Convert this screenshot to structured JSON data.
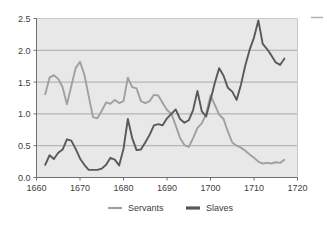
{
  "chart_data": {
    "type": "line",
    "title": "",
    "subtitle": "",
    "xlabel": "",
    "ylabel": "",
    "xlim": [
      1660,
      1720
    ],
    "ylim": [
      0.0,
      2.5
    ],
    "grid": true,
    "legend_position": "bottom",
    "plot_background": "#e8e8e8",
    "x_ticks": [
      "1660",
      "1670",
      "1680",
      "1690",
      "1700",
      "1710",
      "1720"
    ],
    "x_tick_values": [
      1660,
      1670,
      1680,
      1690,
      1700,
      1710,
      1720
    ],
    "y_ticks": [
      "0.0",
      "0.5",
      "1.0",
      "1.5",
      "2.0",
      "2.5"
    ],
    "y_tick_values": [
      0.0,
      0.5,
      1.0,
      1.5,
      2.0,
      2.5
    ],
    "series": [
      {
        "name": "Servants",
        "color": "#a0a0a0",
        "x": [
          1662,
          1663,
          1664,
          1665,
          1666,
          1667,
          1668,
          1669,
          1670,
          1671,
          1672,
          1673,
          1674,
          1675,
          1676,
          1677,
          1678,
          1679,
          1680,
          1681,
          1682,
          1683,
          1684,
          1685,
          1686,
          1687,
          1688,
          1689,
          1690,
          1691,
          1692,
          1693,
          1694,
          1695,
          1696,
          1697,
          1698,
          1699,
          1700,
          1701,
          1702,
          1703,
          1704,
          1705,
          1706,
          1707,
          1708,
          1709,
          1710,
          1711,
          1712,
          1713,
          1714,
          1715,
          1716,
          1717
        ],
        "values": [
          1.31,
          1.57,
          1.61,
          1.55,
          1.42,
          1.15,
          1.44,
          1.72,
          1.82,
          1.62,
          1.28,
          0.95,
          0.93,
          1.05,
          1.18,
          1.16,
          1.22,
          1.17,
          1.2,
          1.57,
          1.42,
          1.4,
          1.2,
          1.17,
          1.2,
          1.3,
          1.29,
          1.17,
          1.06,
          1.0,
          0.82,
          0.62,
          0.51,
          0.48,
          0.62,
          0.78,
          0.85,
          1.0,
          1.29,
          1.14,
          0.99,
          0.92,
          0.72,
          0.55,
          0.5,
          0.47,
          0.42,
          0.36,
          0.31,
          0.25,
          0.22,
          0.23,
          0.22,
          0.24,
          0.23,
          0.28
        ]
      },
      {
        "name": "Slaves",
        "color": "#595959",
        "x": [
          1662,
          1663,
          1664,
          1665,
          1666,
          1667,
          1668,
          1669,
          1670,
          1671,
          1672,
          1673,
          1674,
          1675,
          1676,
          1677,
          1678,
          1679,
          1680,
          1681,
          1682,
          1683,
          1684,
          1685,
          1686,
          1687,
          1688,
          1689,
          1690,
          1691,
          1692,
          1693,
          1694,
          1695,
          1696,
          1697,
          1698,
          1699,
          1700,
          1701,
          1702,
          1703,
          1704,
          1705,
          1706,
          1707,
          1708,
          1709,
          1710,
          1711,
          1712,
          1713,
          1714,
          1715,
          1716,
          1717
        ],
        "values": [
          0.2,
          0.35,
          0.29,
          0.39,
          0.44,
          0.6,
          0.58,
          0.45,
          0.3,
          0.2,
          0.12,
          0.12,
          0.12,
          0.14,
          0.2,
          0.31,
          0.28,
          0.19,
          0.45,
          0.92,
          0.62,
          0.43,
          0.44,
          0.55,
          0.67,
          0.82,
          0.84,
          0.82,
          0.93,
          1.0,
          1.07,
          0.92,
          0.86,
          0.9,
          1.06,
          1.36,
          1.04,
          0.96,
          1.22,
          1.49,
          1.72,
          1.6,
          1.41,
          1.35,
          1.22,
          1.46,
          1.76,
          2.01,
          2.2,
          2.47,
          2.1,
          2.02,
          1.92,
          1.81,
          1.77,
          1.87
        ]
      }
    ]
  },
  "legend": {
    "entries": [
      {
        "label": "Servants",
        "color": "#a0a0a0"
      },
      {
        "label": "Slaves",
        "color": "#595959"
      }
    ]
  },
  "corner_marker": {
    "color": "#b5b5b5"
  }
}
